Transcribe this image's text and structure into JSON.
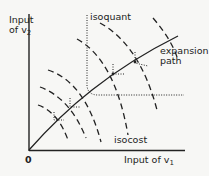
{
  "diagram": {
    "axes": {
      "origin_label": "0",
      "y_label_line1": "Input",
      "y_label_line2_prefix": "of v",
      "y_label_sub": "2",
      "x_label_prefix": "Input of v",
      "x_label_sub": "1"
    },
    "labels": {
      "isoquant": "isoquant",
      "expansion_line1": "expansion",
      "expansion_line2": "path",
      "isocost": "isocost"
    },
    "colors": {
      "line": "#222222",
      "background": "#f7f7f5"
    }
  }
}
